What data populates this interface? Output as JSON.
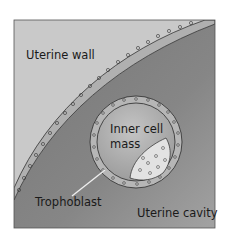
{
  "figure": {
    "labels": {
      "uterine_wall": "Uterine wall",
      "inner_cell_mass_line1": "Inner cell",
      "inner_cell_mass_line2": "mass",
      "trophoblast": "Trophoblast",
      "uterine_cavity": "Uterine cavity"
    },
    "colors": {
      "wall": "#c9c9c9",
      "cavity_dark": "#7d7d7d",
      "cavity_light": "#9c9c9c",
      "blastocoel": "#b3b3b3",
      "cell_fill": "#b8b8b8",
      "icm_fill": "#e0e0e0",
      "outline": "#2a2a2a"
    }
  }
}
